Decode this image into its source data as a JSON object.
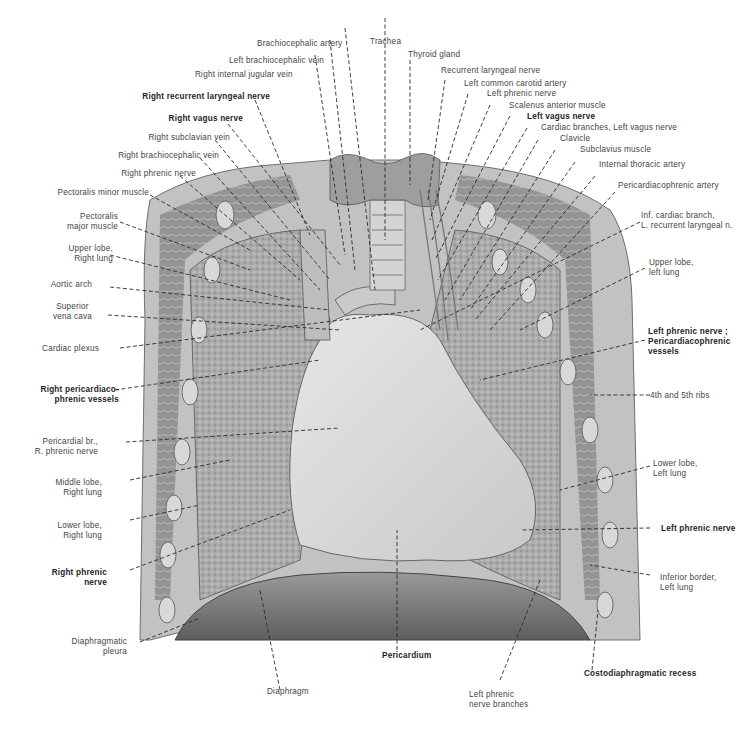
{
  "figure": {
    "colors": {
      "background": "#ffffff",
      "tissue_dark": "#7a7a7a",
      "tissue_light": "#cfcfcf",
      "label_text": "#444444",
      "label_bold": "#1e1e1e"
    }
  },
  "labels": {
    "top": [
      {
        "text": "Brachiocephalic artery",
        "bold": false
      },
      {
        "text": "Trachea",
        "bold": false
      },
      {
        "text": "Left brachiocephalic vein",
        "bold": false
      },
      {
        "text": "Thyroid gland",
        "bold": false
      },
      {
        "text": "Right internal jugular vein",
        "bold": false
      }
    ],
    "left": [
      {
        "text": "Right recurrent laryngeal nerve",
        "bold": true
      },
      {
        "text": "Right vagus nerve",
        "bold": true
      },
      {
        "text": "Right subclavian vein",
        "bold": false
      },
      {
        "text": "Right brachiocephalic vein",
        "bold": false
      },
      {
        "text": "Right phrenic nerve",
        "bold": false
      },
      {
        "text": "Pectoralis minor muscle",
        "bold": false
      },
      {
        "text": "Pectoralis\nmajor muscle",
        "bold": false
      },
      {
        "text": "Upper lobe,\nRight lung",
        "bold": false
      },
      {
        "text": "Aortic arch",
        "bold": false
      },
      {
        "text": "Superior\nvena cava",
        "bold": false
      },
      {
        "text": "Cardiac plexus",
        "bold": false
      },
      {
        "text": "Right pericardiaco-\nphrenic vessels",
        "bold": true
      },
      {
        "text": "Pericardial br.,\nR. phrenic nerve",
        "bold": false
      },
      {
        "text": "Middle lobe,\nRight lung",
        "bold": false
      },
      {
        "text": "Lower lobe,\nRight lung",
        "bold": false
      },
      {
        "text": "Right phrenic\nnerve",
        "bold": true
      },
      {
        "text": "Diaphragmatic\npleura",
        "bold": false
      }
    ],
    "right": [
      {
        "text": "Recurrent laryngeal nerve",
        "bold": false
      },
      {
        "text": "Left common carotid artery",
        "bold": false
      },
      {
        "text": "Left phrenic nerve",
        "bold": false
      },
      {
        "text": "Scalenus anterior muscle",
        "bold": false
      },
      {
        "text": "Left vagus nerve",
        "bold": true
      },
      {
        "text": "Cardiac branches, Left vagus nerve",
        "bold": false
      },
      {
        "text": "Clavicle",
        "bold": false
      },
      {
        "text": "Subclavius muscle",
        "bold": false
      },
      {
        "text": "Internal thoracic artery",
        "bold": false
      },
      {
        "text": "Pericardiacophrenic artery",
        "bold": false
      },
      {
        "text": "Inf. cardiac branch,\nL. recurrent laryngeal n.",
        "bold": false
      },
      {
        "text": "Upper lobe,\nleft lung",
        "bold": false
      },
      {
        "text": "Left phrenic nerve ;\nPericardiacophrenic\nvessels",
        "bold": true
      },
      {
        "text": "4th and 5th ribs",
        "bold": false
      },
      {
        "text": "Lower lobe,\nLeft lung",
        "bold": false
      },
      {
        "text": "Left phrenic nerve",
        "bold": true
      },
      {
        "text": "Inferior border,\nLeft lung",
        "bold": false
      }
    ],
    "bottom": [
      {
        "text": "Pericardium",
        "bold": true
      },
      {
        "text": "Costodiaphragmatic recess",
        "bold": true
      },
      {
        "text": "Diaphragm",
        "bold": false
      },
      {
        "text": "Left phrenic\nnerve branches",
        "bold": false
      }
    ]
  }
}
